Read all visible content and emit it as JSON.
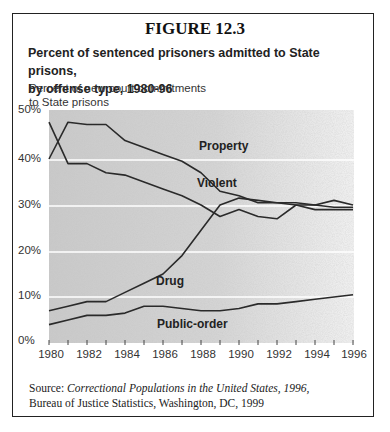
{
  "figure": {
    "number": "FIGURE 12.3",
    "subtitle_line1": "Percent of sentenced prisoners admitted to State prisons,",
    "subtitle_line2": "by offense type, 1980-96",
    "ylabel_line1": "Percent of new court commitments",
    "ylabel_line2": "to State prisons",
    "source_prefix": "Source: ",
    "source_title": "Correctional Populations in the United States, 1996,",
    "source_line2": "Bureau of Justice Statistics, Washington, DC, 1999"
  },
  "axis": {
    "y_ticks": [
      "50%",
      "40%",
      "30%",
      "20%",
      "10%",
      "0%"
    ],
    "x_ticks": [
      "1980",
      "1982",
      "1984",
      "1986",
      "1988",
      "1990",
      "1992",
      "1994",
      "1996"
    ]
  },
  "labels": {
    "property": "Property",
    "violent": "Violent",
    "drug": "Drug",
    "public_order": "Public-order"
  },
  "chart_data": {
    "type": "line",
    "xlabel": "",
    "ylabel": "Percent of new court commitments to State prisons",
    "ylim": [
      0,
      50
    ],
    "xlim": [
      1980,
      1996
    ],
    "grid": "horizontal, white lines at 10% intervals",
    "legend": "inline series labels",
    "x": [
      1980,
      1981,
      1982,
      1983,
      1984,
      1985,
      1986,
      1987,
      1988,
      1989,
      1990,
      1991,
      1992,
      1993,
      1994,
      1995,
      1996
    ],
    "series": [
      {
        "name": "Property",
        "values": [
          40,
          48,
          47.5,
          47.5,
          44,
          42.5,
          41,
          39.5,
          37,
          33,
          32,
          30.5,
          30.5,
          30,
          29,
          29,
          29
        ]
      },
      {
        "name": "Violent",
        "values": [
          48,
          39,
          39,
          37,
          36.5,
          35,
          33.5,
          32,
          30,
          27.5,
          29,
          27.5,
          27,
          30,
          30,
          29.5,
          29.5
        ]
      },
      {
        "name": "Drug",
        "values": [
          7,
          8,
          9,
          9,
          11,
          13,
          15,
          19,
          24.5,
          30,
          31.5,
          31,
          30.5,
          30.5,
          30,
          31,
          30
        ]
      },
      {
        "name": "Public-order",
        "values": [
          4,
          5,
          6,
          6,
          6.5,
          8,
          8,
          7.5,
          7,
          7,
          7.5,
          8.5,
          8.5,
          9,
          9.5,
          10,
          10.5
        ]
      }
    ],
    "source": "Source: Correctional Populations in the United States, 1996, Bureau of Justice Statistics, Washington, DC, 1999"
  }
}
